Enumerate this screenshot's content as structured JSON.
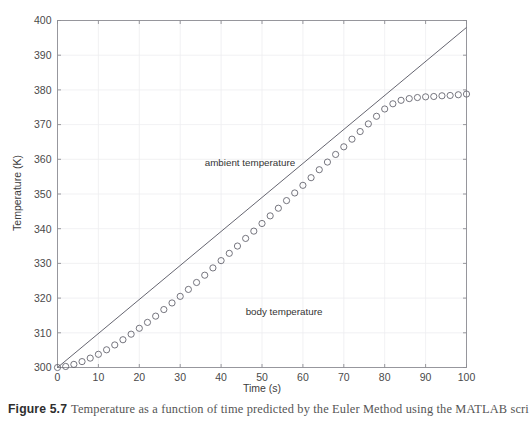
{
  "caption": {
    "label": "Figure 5.7",
    "text": "Temperature as a function of time predicted by the Euler Method using the MATLAB scri"
  },
  "chart_data": {
    "type": "line",
    "title": "",
    "xlabel": "Time (s)",
    "ylabel": "Temperature (K)",
    "xlim": [
      0,
      100
    ],
    "ylim": [
      300,
      400
    ],
    "xticks": [
      0,
      10,
      20,
      30,
      40,
      50,
      60,
      70,
      80,
      90,
      100
    ],
    "yticks": [
      300,
      310,
      320,
      330,
      340,
      350,
      360,
      370,
      380,
      390,
      400
    ],
    "grid": true,
    "legend_position": "inline-annotations",
    "annotations": [
      {
        "text": "ambient temperature",
        "x": 36,
        "y": 358
      },
      {
        "text": "body temperature",
        "x": 46,
        "y": 315
      }
    ],
    "series": [
      {
        "name": "ambient temperature",
        "style": "line",
        "marker": "none",
        "color": "#5d5d68",
        "x": [
          0,
          100
        ],
        "values": [
          300,
          398
        ]
      },
      {
        "name": "body temperature",
        "style": "markers",
        "marker": "open-circle",
        "color": "#5d5d68",
        "x": [
          0,
          2,
          4,
          6,
          8,
          10,
          12,
          14,
          16,
          18,
          20,
          22,
          24,
          26,
          28,
          30,
          32,
          34,
          36,
          38,
          40,
          42,
          44,
          46,
          48,
          50,
          52,
          54,
          56,
          58,
          60,
          62,
          64,
          66,
          68,
          70,
          72,
          74,
          76,
          78,
          80,
          82,
          84,
          86,
          88,
          90,
          92,
          94,
          96,
          98,
          100
        ],
        "values": [
          300.0,
          300.3,
          300.9,
          301.7,
          302.7,
          303.8,
          305.1,
          306.5,
          308.0,
          309.6,
          311.3,
          313.0,
          314.8,
          316.7,
          318.6,
          320.5,
          322.5,
          324.5,
          326.6,
          328.7,
          330.8,
          332.9,
          335.0,
          337.2,
          339.3,
          341.5,
          343.7,
          345.9,
          348.1,
          350.3,
          352.5,
          354.7,
          357.0,
          359.2,
          361.4,
          363.6,
          365.8,
          368.0,
          370.2,
          372.4,
          374.5,
          376.0,
          377.0,
          377.5,
          377.8,
          378.0,
          378.1,
          378.3,
          378.4,
          378.6,
          378.8
        ]
      }
    ]
  }
}
